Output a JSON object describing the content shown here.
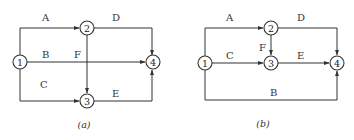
{
  "figure": {
    "diagrams": [
      {
        "caption": "(a)",
        "nodes": [
          {
            "id": "1",
            "label": "1"
          },
          {
            "id": "2",
            "label": "2"
          },
          {
            "id": "3",
            "label": "3"
          },
          {
            "id": "4",
            "label": "4"
          }
        ],
        "edges": [
          {
            "label": "A",
            "from": "1",
            "to": "2"
          },
          {
            "label": "B",
            "from": "1",
            "to": "4"
          },
          {
            "label": "C",
            "from": "1",
            "to": "3"
          },
          {
            "label": "D",
            "from": "2",
            "to": "4"
          },
          {
            "label": "E",
            "from": "3",
            "to": "4"
          },
          {
            "label": "F",
            "from": "2",
            "to": "3"
          }
        ]
      },
      {
        "caption": "(b)",
        "nodes": [
          {
            "id": "1",
            "label": "1"
          },
          {
            "id": "2",
            "label": "2"
          },
          {
            "id": "3",
            "label": "3"
          },
          {
            "id": "4",
            "label": "4"
          }
        ],
        "edges": [
          {
            "label": "A",
            "from": "1",
            "to": "2"
          },
          {
            "label": "C",
            "from": "1",
            "to": "3"
          },
          {
            "label": "B",
            "from": "1",
            "to": "4"
          },
          {
            "label": "D",
            "from": "2",
            "to": "4"
          },
          {
            "label": "E",
            "from": "3",
            "to": "4"
          },
          {
            "label": "F",
            "from": "2",
            "to": "3"
          }
        ]
      }
    ]
  }
}
